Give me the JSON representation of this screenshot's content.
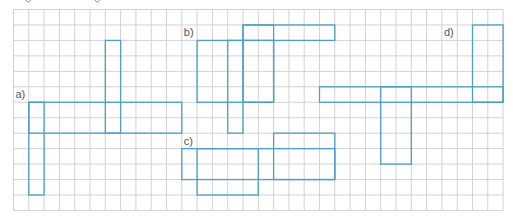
{
  "figure": {
    "width": 513,
    "height": 222,
    "colors": {
      "grid": "#d2d2d2",
      "shape": "#4d9fc9",
      "label": "#555555",
      "background": "#ffffff"
    },
    "grid": {
      "origin_x": 13.5,
      "origin_y": 9.5,
      "cell_w": 15.3,
      "cell_h": 15.46,
      "cols": 32,
      "rows": 13
    },
    "figures": [
      {
        "id": "a",
        "label": "a)",
        "label_cell": [
          0,
          5
        ],
        "rects": [
          {
            "x0": 1,
            "y0": 6,
            "x1": 11,
            "y1": 8
          },
          {
            "x0": 1,
            "y0": 6,
            "x1": 2,
            "y1": 12
          },
          {
            "x0": 6,
            "y0": 2,
            "x1": 7,
            "y1": 8
          }
        ]
      },
      {
        "id": "b",
        "label": "b)",
        "label_cell": [
          11,
          1
        ],
        "rects": [
          {
            "x0": 15,
            "y0": 1,
            "x1": 21,
            "y1": 2
          },
          {
            "x0": 12,
            "y0": 2,
            "x1": 17,
            "y1": 6
          },
          {
            "x0": 14,
            "y0": 2,
            "x1": 15,
            "y1": 8
          },
          {
            "x0": 15,
            "y0": 1,
            "x1": 17,
            "y1": 6
          }
        ]
      },
      {
        "id": "c",
        "label": "c)",
        "label_cell": [
          11,
          8
        ],
        "rects": [
          {
            "x0": 11,
            "y0": 9,
            "x1": 21,
            "y1": 11
          },
          {
            "x0": 12,
            "y0": 9,
            "x1": 16,
            "y1": 12
          },
          {
            "x0": 17,
            "y0": 8,
            "x1": 21,
            "y1": 11
          }
        ]
      },
      {
        "id": "d",
        "label": "d)",
        "label_cell": [
          28,
          1
        ],
        "rects": [
          {
            "x0": 20,
            "y0": 5,
            "x1": 32,
            "y1": 6
          },
          {
            "x0": 24,
            "y0": 5,
            "x1": 26,
            "y1": 10
          },
          {
            "x0": 30,
            "y0": 1,
            "x1": 32,
            "y1": 6
          }
        ]
      }
    ]
  }
}
